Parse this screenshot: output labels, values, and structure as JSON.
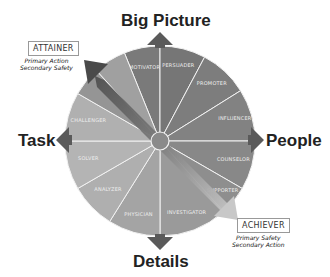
{
  "diagram": {
    "type": "behavior-style-wheel",
    "axes": {
      "top": "Big Picture",
      "bottom": "Details",
      "left": "Task",
      "right": "People"
    },
    "segments": [
      {
        "label": "MOTIVATOR",
        "color": "#7a7a7a"
      },
      {
        "label": "PERSUADER",
        "color": "#767676"
      },
      {
        "label": "PROMOTER",
        "color": "#7d7d7d"
      },
      {
        "label": "INFLUENCER",
        "color": "#828282"
      },
      {
        "label": "COUNSELOR",
        "color": "#888888"
      },
      {
        "label": "SUPPORTER",
        "color": "#8e8e8e"
      },
      {
        "label": "INVESTIGATOR",
        "color": "#9a9a9a"
      },
      {
        "label": "PHYSICIAN",
        "color": "#a4a4a4"
      },
      {
        "label": "ANALYZER",
        "color": "#afafaf"
      },
      {
        "label": "SOLVER",
        "color": "#b4b4b4"
      },
      {
        "label": "CHALLENGER",
        "color": "#b0b0b0"
      },
      {
        "label": "",
        "color": "#959595"
      },
      {
        "label": "",
        "color": "#a0a0a0"
      }
    ],
    "callouts": {
      "attainer": {
        "title": "ATTAINER",
        "line1": "Primary Action",
        "line2": "Secondary Safety"
      },
      "achiever": {
        "title": "ACHIEVER",
        "line1": "Primary Safety",
        "line2": "Secondary Action"
      }
    },
    "colors": {
      "arrow": "#5a5a5a",
      "diagonal_dark": "#4e4e4e",
      "diagonal_light": "#bcbcbc",
      "divider": "#f2f2f2"
    }
  }
}
